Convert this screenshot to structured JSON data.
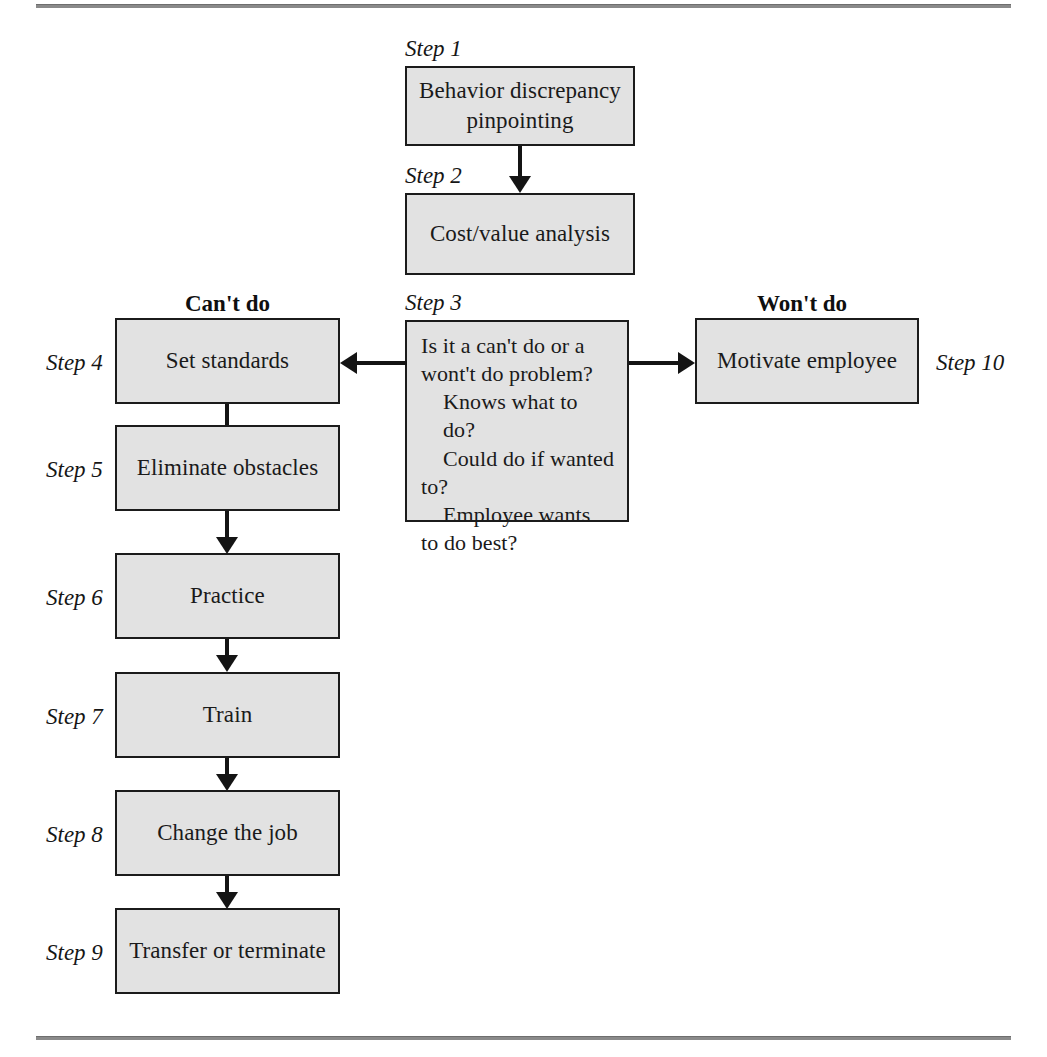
{
  "diagram": {
    "type": "flowchart",
    "title": "",
    "column_headers": {
      "left": "Can't do",
      "right": "Won't do"
    },
    "nodes": [
      {
        "id": "step1",
        "step_label": "Step 1",
        "text": "Behavior discrepancy pinpointing",
        "column": "center"
      },
      {
        "id": "step2",
        "step_label": "Step 2",
        "text": "Cost/value analysis",
        "column": "center"
      },
      {
        "id": "step3",
        "step_label": "Step 3",
        "line1": "Is it a can't do or a",
        "line2": "wont't do problem?",
        "line3": "Knows what to do?",
        "line4": "Could do if wanted",
        "line5": "to?",
        "line6": "Employee wants",
        "line7": "to do best?",
        "column": "center"
      },
      {
        "id": "step4",
        "step_label": "Step 4",
        "text": "Set standards",
        "column": "left"
      },
      {
        "id": "step5",
        "step_label": "Step 5",
        "text": "Eliminate obstacles",
        "column": "left"
      },
      {
        "id": "step6",
        "step_label": "Step 6",
        "text": "Practice",
        "column": "left"
      },
      {
        "id": "step7",
        "step_label": "Step 7",
        "text": "Train",
        "column": "left"
      },
      {
        "id": "step8",
        "step_label": "Step 8",
        "text": "Change the job",
        "column": "left"
      },
      {
        "id": "step9",
        "step_label": "Step 9",
        "text": "Transfer or terminate",
        "column": "left"
      },
      {
        "id": "step10",
        "step_label": "Step 10",
        "text": "Motivate employee",
        "column": "right"
      }
    ],
    "edges": [
      {
        "from": "step1",
        "to": "step2",
        "direction": "down"
      },
      {
        "from": "step3",
        "to": "step4",
        "direction": "left"
      },
      {
        "from": "step3",
        "to": "step10",
        "direction": "right"
      },
      {
        "from": "step4",
        "to": "step5",
        "direction": "down"
      },
      {
        "from": "step5",
        "to": "step6",
        "direction": "down"
      },
      {
        "from": "step6",
        "to": "step7",
        "direction": "down"
      },
      {
        "from": "step7",
        "to": "step8",
        "direction": "down"
      },
      {
        "from": "step8",
        "to": "step9",
        "direction": "down"
      }
    ],
    "colors": {
      "node_fill": "#e2e2e2",
      "node_border": "#1b1b1b",
      "connector": "#141414",
      "rule": "#8a8a8a",
      "text": "#1a1a1a",
      "background": "#ffffff"
    }
  }
}
